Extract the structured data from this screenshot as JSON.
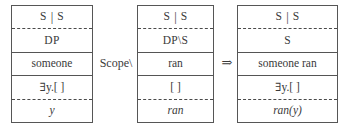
{
  "diagram": {
    "colors": {
      "border": "#565656",
      "text": "#3a3a3a",
      "background": "#ffffff"
    },
    "boxes": [
      {
        "id": "box-someone",
        "name": "derivation-box-someone",
        "rows": [
          {
            "id": "category-top",
            "text": "S | S",
            "left": "S",
            "sep": "|",
            "right": "S",
            "style": "cat",
            "divider": "none"
          },
          {
            "id": "category",
            "text": "DP",
            "style": "cat",
            "divider": "dashed"
          },
          {
            "id": "word",
            "text": "someone",
            "style": "word",
            "divider": "solid"
          },
          {
            "id": "logic",
            "text": "∃y.[ ]",
            "style": "logic",
            "divider": "solid"
          },
          {
            "id": "term",
            "text": "y",
            "style": "italic",
            "divider": "dashed"
          }
        ]
      },
      {
        "id": "box-ran",
        "name": "derivation-box-ran",
        "rows": [
          {
            "id": "category-top",
            "text": "S | S",
            "left": "S",
            "sep": "|",
            "right": "S",
            "style": "cat",
            "divider": "none"
          },
          {
            "id": "category",
            "text": "DP\\S",
            "style": "cat",
            "divider": "dashed"
          },
          {
            "id": "word",
            "text": "ran",
            "style": "word",
            "divider": "solid"
          },
          {
            "id": "logic",
            "text": "[ ]",
            "style": "logic",
            "divider": "solid"
          },
          {
            "id": "term",
            "text": "ran",
            "style": "italic",
            "divider": "dashed"
          }
        ]
      },
      {
        "id": "box-someone-ran",
        "name": "derivation-box-someone-ran",
        "rows": [
          {
            "id": "category-top",
            "text": "S | S",
            "left": "S",
            "sep": "|",
            "right": "S",
            "style": "cat",
            "divider": "none"
          },
          {
            "id": "category",
            "text": "S",
            "style": "cat",
            "divider": "dashed"
          },
          {
            "id": "word",
            "text": "someone ran",
            "style": "word",
            "divider": "solid"
          },
          {
            "id": "logic",
            "text": "∃y.[ ]",
            "style": "logic",
            "divider": "solid"
          },
          {
            "id": "term",
            "text": "ran(y)",
            "style": "italic",
            "divider": "dashed"
          }
        ]
      }
    ],
    "connectors": [
      {
        "id": "operator",
        "name": "scope-operator-label",
        "text": "Scope\\"
      },
      {
        "id": "result",
        "name": "implies-arrow-icon",
        "text": "⇒"
      }
    ]
  }
}
